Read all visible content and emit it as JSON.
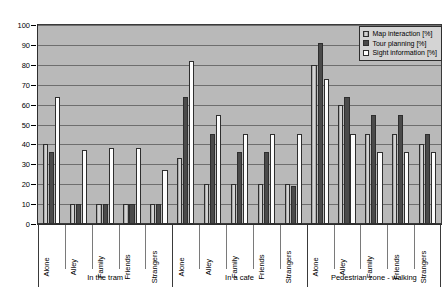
{
  "chart_data": {
    "type": "bar",
    "title": "",
    "xlabel": "",
    "ylabel": "",
    "ylim": [
      0,
      100
    ],
    "ytick_step": 10,
    "yticks": [
      0,
      10,
      20,
      30,
      40,
      50,
      60,
      70,
      80,
      90,
      100
    ],
    "grid": true,
    "legend_position": "top-right",
    "groups": [
      {
        "label": "In the tram",
        "categories": [
          "Alone",
          "Alley",
          "Family",
          "Friends",
          "Strangers"
        ]
      },
      {
        "label": "In a cafe",
        "categories": [
          "Alone",
          "Alley",
          "Family",
          "Friends",
          "Strangers"
        ]
      },
      {
        "label": "Pedestrian zone  - walking",
        "categories": [
          "Alone",
          "Alley",
          "Family",
          "Friends",
          "Strangers"
        ]
      }
    ],
    "categories": [
      "Alone",
      "Alley",
      "Family",
      "Friends",
      "Strangers",
      "Alone",
      "Alley",
      "Family",
      "Friends",
      "Strangers",
      "Alone",
      "Alley",
      "Family",
      "Friends",
      "Strangers"
    ],
    "series": [
      {
        "name": "Map interaction [%]",
        "color": "#c8c8c8",
        "values": [
          40,
          10,
          10,
          10,
          10,
          33,
          20,
          20,
          20,
          20,
          80,
          60,
          45,
          45,
          40
        ]
      },
      {
        "name": "Tour planning [%]",
        "color": "#4a4a4a",
        "values": [
          36,
          10,
          10,
          10,
          10,
          64,
          45,
          36,
          36,
          19,
          91,
          64,
          55,
          55,
          45
        ]
      },
      {
        "name": "Sight information [%]",
        "color": "#fdfdfd",
        "values": [
          64,
          37,
          38,
          38,
          27,
          82,
          55,
          45,
          45,
          45,
          73,
          45,
          36,
          36,
          36
        ]
      }
    ]
  },
  "legend": {
    "items": [
      {
        "label": "Map interaction [%]",
        "swatch": "#c8c8c8"
      },
      {
        "label": "Tour planning [%]",
        "swatch": "#4a4a4a"
      },
      {
        "label": "Sight information [%]",
        "swatch": "#fdfdfd"
      }
    ]
  },
  "colors": {
    "plot_background": "#b9b9b9",
    "gridline": "#6e6e6e",
    "axis": "#2e2e2e",
    "legend_background": "#d4d4d4"
  }
}
